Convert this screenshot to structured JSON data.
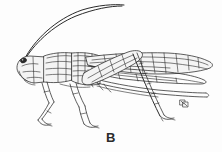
{
  "figure": {
    "caption_label": "B",
    "style": "pen-and-ink scientific line drawing",
    "orientation": "facing left",
    "background_color": "#fdfdfd",
    "ink_color": "#2a2a2a",
    "caption_color": "#2b2b2b",
    "canvas": {
      "width": 222,
      "height": 152
    }
  },
  "anatomy": {
    "parts": [
      {
        "name": "antenna-upper",
        "label": "Antenna (upper)",
        "description": "long slender filament arcing up and to the right from the head"
      },
      {
        "name": "antenna-lower",
        "label": "Antenna (lower)",
        "description": "second filament paralleling the first, slightly lower"
      },
      {
        "name": "compound-eye",
        "label": "Compound eye",
        "description": "small dark oval at the front of the head"
      },
      {
        "name": "head",
        "label": "Head",
        "description": "pale wedge-shaped head at far left"
      },
      {
        "name": "pronotum",
        "label": "Pronotum",
        "description": "saddle-shaped thoracic shield with fine hatching"
      },
      {
        "name": "thorax",
        "label": "Thorax",
        "description": "densely hatched segment bearing the legs and wings"
      },
      {
        "name": "forewing",
        "label": "Forewing (tegmen)",
        "description": "long stippled wing with reticulate venation extending to the right"
      },
      {
        "name": "hindwing",
        "label": "Hindwing",
        "description": "second narrower wing folded beneath the forewing"
      },
      {
        "name": "abdomen",
        "label": "Abdomen",
        "description": "elongate body with parallel longitudinal lines trailing far to the right"
      },
      {
        "name": "foreleg",
        "label": "Foreleg",
        "description": "short front leg with femur, tibia and tarsus"
      },
      {
        "name": "midleg",
        "label": "Midleg",
        "description": "middle leg angled down and back"
      },
      {
        "name": "hindleg-femur",
        "label": "Hind femur",
        "description": "stout jumping femur overlapping the wing base"
      },
      {
        "name": "hindleg-tibia",
        "label": "Hind tibia",
        "description": "long spined tibia descending diagonally to the lower right"
      },
      {
        "name": "hind-tarsus",
        "label": "Hind tarsus",
        "description": "small foot at the end of the hind tibia"
      },
      {
        "name": "inset-detail",
        "label": "Inset detail",
        "description": "tiny magnified structure drawn at lower right"
      }
    ]
  }
}
